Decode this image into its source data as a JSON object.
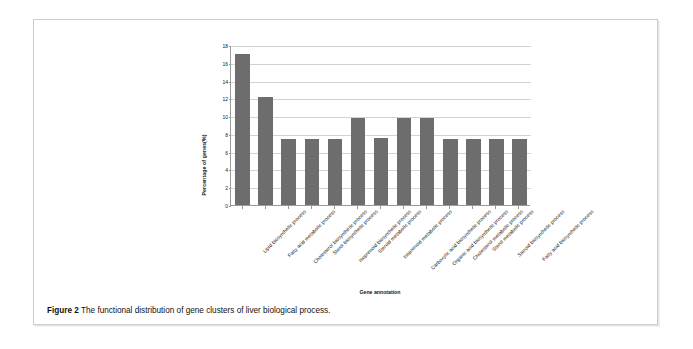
{
  "figure": {
    "caption_label": "Figure 2",
    "caption_text": "The functional distribution of gene clusters of liver biological process."
  },
  "chart_data": {
    "type": "bar",
    "title": "",
    "xlabel": "Gene annotation",
    "ylabel": "Percentage of genes(%)",
    "ylim": [
      0,
      18
    ],
    "ytick_step": 2,
    "grid": true,
    "legend": "none",
    "bar_color": "#6d6d6d",
    "gridline_color": "#d2d2d2",
    "axis_color": "#9a9a9a",
    "ytick_labels": [
      "18",
      "16",
      "14",
      "12",
      "10",
      "8",
      "6",
      "4",
      "2",
      "0"
    ],
    "categories": [
      "Lipid biosynthetic process",
      "Fatty acid metabolic process",
      "Cholesterol biosynthetic process",
      "Sterol biosynthetic process",
      "Isoprenoid biosynthetic process",
      "Steroid metabolic process",
      "Isoprenoid metabolic process",
      "Carboxylic acid biosynthetic process",
      "Organic acid biosynthetic process",
      "Cholesterol metabolic process",
      "Sterol metabolic process",
      "Steroid biosynthetic process",
      "Fatty acid biosynthetic process"
    ],
    "values": [
      17.0,
      12.2,
      7.4,
      7.4,
      7.4,
      9.8,
      7.5,
      9.8,
      9.8,
      7.4,
      7.4,
      7.4,
      7.4
    ]
  }
}
